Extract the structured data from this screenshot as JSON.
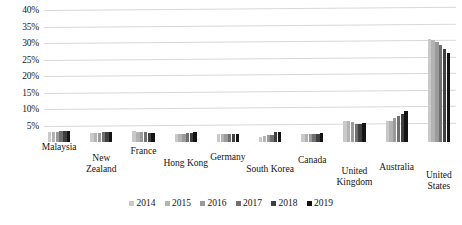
{
  "chart_data": {
    "type": "bar",
    "title": "",
    "subtitle": "",
    "xlabel": "",
    "ylabel": "",
    "ylim": [
      0,
      40
    ],
    "ytick_labels": [
      "40%",
      "35%",
      "30%",
      "25%",
      "20%",
      "15%",
      "10%",
      "5%"
    ],
    "ytick_values": [
      40,
      35,
      30,
      25,
      20,
      15,
      10,
      5
    ],
    "grid": true,
    "legend_position": "bottom",
    "categories": [
      "Malaysia",
      "New Zealand",
      "France",
      "Hong Kong",
      "Germany",
      "South Korea",
      "Canada",
      "United Kingdom",
      "Australia",
      "United States"
    ],
    "series": [
      {
        "name": "2014",
        "color": "#c9c9c9",
        "values": [
          3.0,
          2.8,
          3.2,
          2.4,
          2.3,
          1.6,
          2.3,
          6.5,
          6.3,
          31.3
        ]
      },
      {
        "name": "2015",
        "color": "#b3b3b3",
        "values": [
          3.0,
          2.8,
          3.1,
          2.4,
          2.3,
          1.8,
          2.3,
          6.4,
          6.4,
          31.0
        ]
      },
      {
        "name": "2016",
        "color": "#9a9a9a",
        "values": [
          3.1,
          2.8,
          3.0,
          2.5,
          2.3,
          2.0,
          2.3,
          6.2,
          7.2,
          30.3
        ]
      },
      {
        "name": "2017",
        "color": "#6f6f6f",
        "values": [
          3.2,
          2.9,
          2.9,
          2.6,
          2.4,
          2.2,
          2.4,
          5.6,
          7.9,
          29.4
        ]
      },
      {
        "name": "2018",
        "color": "#3f3f3f",
        "values": [
          3.3,
          3.0,
          2.8,
          2.7,
          2.4,
          2.9,
          2.5,
          5.6,
          8.6,
          28.2
        ]
      },
      {
        "name": "2019",
        "color": "#141414",
        "values": [
          3.3,
          3.0,
          2.8,
          2.9,
          2.5,
          2.9,
          2.6,
          5.9,
          9.4,
          26.9
        ]
      }
    ]
  }
}
